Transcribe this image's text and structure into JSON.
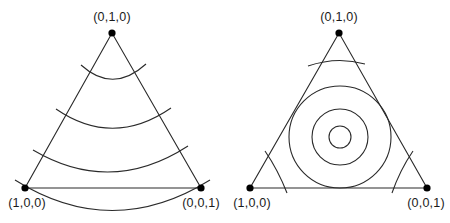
{
  "panels": [
    {
      "id": "left",
      "vertices": [
        {
          "label": "(0,1,0)",
          "x": 112,
          "y": 33,
          "label_x": 112,
          "label_y": 10
        },
        {
          "label": "(1,0,0)",
          "x": 25,
          "y": 188,
          "label_x": 27,
          "label_y": 196
        },
        {
          "label": "(0,0,1)",
          "x": 201,
          "y": 188,
          "label_x": 201,
          "label_y": 196
        }
      ],
      "contours": [
        {
          "type": "arc",
          "d": "M 81 65 Q 113 94 146 64"
        },
        {
          "type": "arc",
          "d": "M 56 109 Q 113 148 171 108"
        },
        {
          "type": "arc",
          "d": "M 33 150 Q 111 196 188 146"
        },
        {
          "type": "arc",
          "d": "M 15 180 Q 112 241 210 180"
        }
      ]
    },
    {
      "id": "right",
      "vertices": [
        {
          "label": "(0,1,0)",
          "x": 339,
          "y": 33,
          "label_x": 339,
          "label_y": 10
        },
        {
          "label": "(1,0,0)",
          "x": 250,
          "y": 188,
          "label_x": 252,
          "label_y": 196
        },
        {
          "label": "(0,0,1)",
          "x": 427,
          "y": 188,
          "label_x": 426,
          "label_y": 196
        }
      ],
      "contours": [
        {
          "type": "arc",
          "d": "M 308 66 Q 337 56 365 64"
        },
        {
          "type": "circle",
          "cx": 340,
          "cy": 137,
          "r": 51
        },
        {
          "type": "circle",
          "cx": 340,
          "cy": 137,
          "r": 28
        },
        {
          "type": "circle",
          "cx": 340,
          "cy": 137,
          "r": 11
        },
        {
          "type": "arc",
          "d": "M 265 151 Q 278 170 287 193"
        },
        {
          "type": "arc",
          "d": "M 413 151 Q 400 170 392 193"
        }
      ]
    }
  ]
}
